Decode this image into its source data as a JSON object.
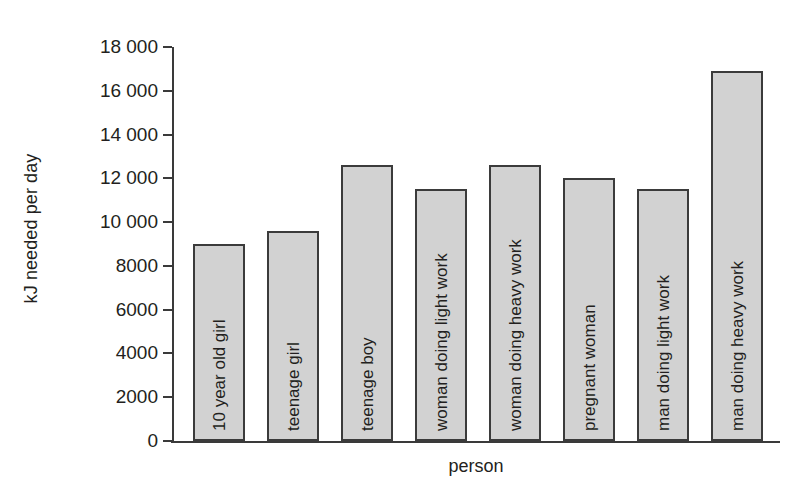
{
  "chart_data": {
    "type": "bar",
    "title": "",
    "xlabel": "person",
    "ylabel": "kJ needed per day",
    "categories": [
      "10 year old girl",
      "teenage girl",
      "teenage boy",
      "woman doing light work",
      "woman doing heavy work",
      "pregnant woman",
      "man doing light work",
      "man doing heavy work"
    ],
    "values": [
      9000,
      9600,
      12600,
      11500,
      12600,
      12000,
      11500,
      16900
    ],
    "ylim": [
      0,
      18000
    ],
    "ytick_values": [
      0,
      2000,
      4000,
      6000,
      8000,
      10000,
      12000,
      14000,
      16000,
      18000
    ],
    "ytick_labels": [
      "0",
      "2000",
      "4000",
      "6000",
      "8000",
      "10 000",
      "12 000",
      "14 000",
      "16 000",
      "18 000"
    ],
    "grid": false,
    "legend": false,
    "bar_fill_color": "#d2d2d2",
    "bar_edge_color": "#3b3b3b",
    "axis_color": "#3a3a3a",
    "background_color": "#ffffff",
    "labels_inside_bars": true,
    "label_rotation": -90
  }
}
